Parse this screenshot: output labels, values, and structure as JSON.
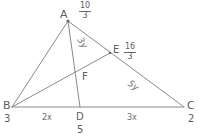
{
  "figure": {
    "type": "geometry-diagram",
    "shape": "triangle-with-cevians",
    "stroke_color": "#8a8a8a",
    "text_color": "#5e5e5e",
    "background": "#ffffff"
  },
  "vertices": {
    "A": {
      "letter": "A",
      "value": "",
      "x": 68,
      "y": 21
    },
    "B": {
      "letter": "B",
      "value": "3",
      "x": 12,
      "y": 107
    },
    "C": {
      "letter": "C",
      "value": "2",
      "x": 184,
      "y": 107
    }
  },
  "points": {
    "D": {
      "letter": "D",
      "value": "5",
      "x": 80,
      "y": 107
    },
    "E": {
      "letter": "E",
      "value": "",
      "x": 110,
      "y": 53
    },
    "F": {
      "letter": "F",
      "value": "",
      "x": 78,
      "y": 76
    }
  },
  "fractions": {
    "at_A": {
      "numerator": "10",
      "denominator": "3"
    },
    "at_E": {
      "numerator": "16",
      "denominator": "3"
    }
  },
  "segment_labels": {
    "BD": "2x",
    "DC": "3x"
  },
  "angle_labels": {
    "at_A_toward_E": "3y",
    "at_E_toward_C": "5y"
  },
  "edges": [
    {
      "name": "AB",
      "from": "A",
      "to": "B"
    },
    {
      "name": "AC",
      "from": "A",
      "to": "C"
    },
    {
      "name": "BC",
      "from": "B",
      "to": "C"
    },
    {
      "name": "AD",
      "from": "A",
      "to": "D"
    },
    {
      "name": "BE",
      "from": "B",
      "to": "E"
    }
  ]
}
